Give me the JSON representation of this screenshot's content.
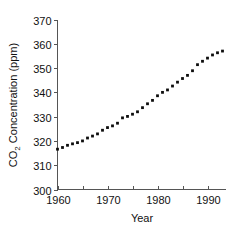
{
  "chart_data": {
    "type": "scatter",
    "title": "",
    "xlabel": "Year",
    "ylabel_parts": {
      "pre": "CO",
      "sub": "2",
      "post": " Concentration (ppm)"
    },
    "ylabel": "CO2 Concentration (ppm)",
    "xlim": [
      1958,
      1994
    ],
    "ylim": [
      300,
      370
    ],
    "grid": false,
    "legend": null,
    "x_major_ticks": [
      1960,
      1970,
      1980,
      1990
    ],
    "x_minor_ticks": [
      1965,
      1975,
      1985
    ],
    "x_tick_labels": [
      "1960",
      "1970",
      "1980",
      "1990"
    ],
    "y_ticks": [
      300,
      310,
      320,
      330,
      340,
      350,
      360,
      370
    ],
    "y_tick_labels": [
      "300",
      "310",
      "320",
      "330",
      "340",
      "350",
      "360",
      "370"
    ],
    "marker": "filled-square",
    "series": [
      {
        "name": "Mauna Loa annual mean CO2",
        "x": [
          1960,
          1961,
          1962,
          1963,
          1964,
          1965,
          1966,
          1967,
          1968,
          1969,
          1970,
          1971,
          1972,
          1973,
          1974,
          1975,
          1976,
          1977,
          1978,
          1979,
          1980,
          1981,
          1982,
          1983,
          1984,
          1985,
          1986,
          1987,
          1988,
          1989,
          1990,
          1991,
          1992,
          1993
        ],
        "y": [
          316.6,
          317.3,
          318.2,
          318.8,
          319.3,
          320.0,
          321.2,
          322.0,
          322.9,
          324.4,
          325.5,
          326.2,
          327.3,
          329.5,
          330.1,
          331.0,
          332.0,
          333.7,
          335.3,
          336.7,
          338.6,
          340.0,
          341.0,
          342.6,
          344.2,
          345.7,
          347.0,
          348.9,
          351.4,
          352.8,
          354.1,
          355.4,
          356.3,
          357.0
        ]
      }
    ]
  }
}
